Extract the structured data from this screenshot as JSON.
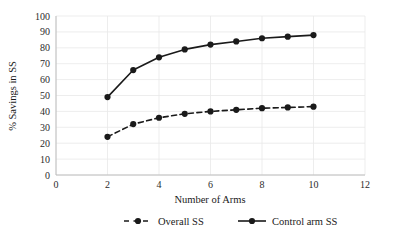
{
  "chart_data": {
    "type": "line",
    "title": "",
    "xlabel": "Number of Arms",
    "ylabel": "% Savings in SS",
    "xlim": [
      0,
      12
    ],
    "ylim": [
      0,
      100
    ],
    "xticks": [
      0,
      2,
      4,
      6,
      8,
      10,
      12
    ],
    "yticks": [
      0,
      10,
      20,
      30,
      40,
      50,
      60,
      70,
      80,
      90,
      100
    ],
    "xtick_labels": [
      "0",
      "2",
      "4",
      "6",
      "8",
      "10",
      "12"
    ],
    "ytick_labels": [
      "0",
      "10",
      "20",
      "30",
      "40",
      "50",
      "60",
      "70",
      "80",
      "90",
      "100"
    ],
    "grid": true,
    "grid_axis": "y",
    "legend_position": "bottom",
    "x": [
      2,
      3,
      4,
      5,
      6,
      7,
      8,
      9,
      10
    ],
    "series": [
      {
        "name": "Overall SS",
        "values": [
          24,
          32,
          36,
          38.5,
          40,
          41,
          42,
          42.5,
          43
        ],
        "line_style": "dashed",
        "marker": "circle",
        "color": "#1a1a1a"
      },
      {
        "name": "Control arm SS",
        "values": [
          49,
          66,
          74,
          79,
          82,
          84,
          86,
          87,
          88
        ],
        "line_style": "solid",
        "marker": "circle",
        "color": "#1a1a1a"
      }
    ]
  },
  "legend": {
    "items": [
      {
        "label": "Overall SS",
        "style": "dashed"
      },
      {
        "label": "Control arm SS",
        "style": "solid"
      }
    ]
  },
  "colors": {
    "series": "#1a1a1a",
    "grid": "#e9e9e9",
    "axis": "#b9b9b9",
    "background": "#ffffff"
  }
}
